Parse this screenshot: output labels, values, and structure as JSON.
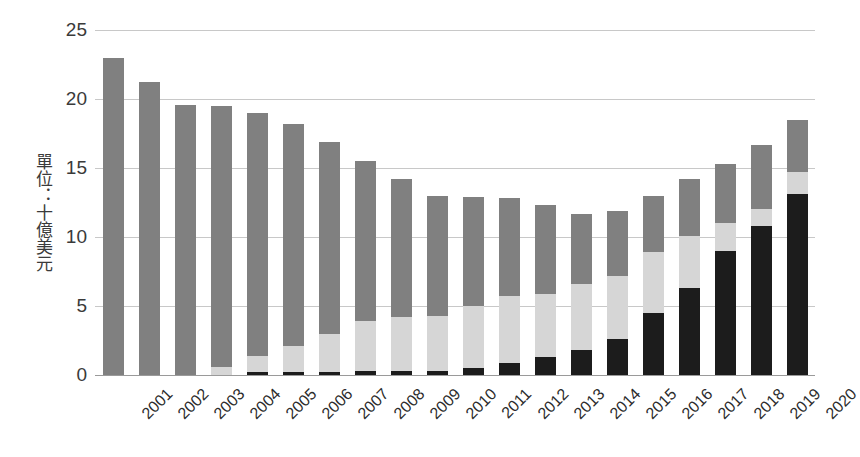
{
  "chart_data": {
    "type": "bar",
    "stacked": true,
    "title": "",
    "xlabel": "",
    "ylabel": "單位：十億美元",
    "ylim": [
      0,
      25
    ],
    "yticks": [
      0,
      5,
      10,
      15,
      20,
      25
    ],
    "grid": true,
    "legend": null,
    "categories": [
      "2001",
      "2002",
      "2003",
      "2004",
      "2005",
      "2006",
      "2007",
      "2008",
      "2009",
      "2010",
      "2011",
      "2012",
      "2013",
      "2014",
      "2015",
      "2016",
      "2017",
      "2018",
      "2019",
      "2020"
    ],
    "series": [
      {
        "name": "series-dark",
        "color": "#1c1c1c",
        "values": [
          0,
          0,
          0,
          0,
          0.25,
          0.25,
          0.25,
          0.3,
          0.3,
          0.3,
          0.5,
          0.9,
          1.3,
          1.8,
          2.6,
          4.5,
          6.3,
          9.0,
          10.8,
          13.1
        ]
      },
      {
        "name": "series-light",
        "color": "#d6d6d6",
        "values": [
          0,
          0,
          0,
          0.55,
          1.15,
          1.85,
          2.75,
          3.6,
          3.9,
          4.0,
          4.5,
          4.8,
          4.6,
          4.8,
          4.6,
          4.4,
          3.8,
          2.0,
          1.2,
          1.6
        ]
      },
      {
        "name": "series-mid",
        "color": "#808080",
        "values": [
          23.0,
          21.2,
          19.6,
          18.95,
          17.6,
          16.1,
          13.9,
          11.6,
          10.0,
          8.7,
          7.9,
          7.1,
          6.4,
          5.1,
          4.7,
          4.1,
          4.1,
          4.3,
          4.7,
          3.8
        ]
      }
    ],
    "totals": [
      23.0,
      21.2,
      19.6,
      19.5,
      19.0,
      18.2,
      16.9,
      15.5,
      14.2,
      13.0,
      12.9,
      12.8,
      12.3,
      11.7,
      11.9,
      13.0,
      14.2,
      15.3,
      16.7,
      18.5
    ]
  }
}
